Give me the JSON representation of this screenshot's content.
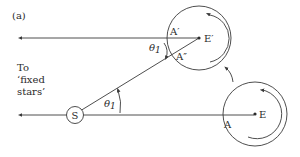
{
  "figure": {
    "panel_label": "(a)",
    "direction_label": {
      "line1": "To",
      "line2": "‘fixed",
      "line3": "stars’"
    },
    "sun": {
      "label": "S"
    },
    "earth_initial": {
      "center_label": "E",
      "point_label": "A"
    },
    "earth_later": {
      "center_label": "E′",
      "point_label_1": "A′",
      "point_label_2": "A″"
    },
    "angle_labels": {
      "near_sun": "θ",
      "near_sun_sub": "1",
      "near_earth": "θ",
      "near_earth_sub": "1"
    },
    "icons": [
      "rotation-arrow-icon",
      "orbit-arrow-icon",
      "direction-arrow-icon"
    ],
    "colors": {
      "line": "#3a3a3a",
      "text": "#2a2a2a",
      "background": "#ffffff"
    }
  }
}
